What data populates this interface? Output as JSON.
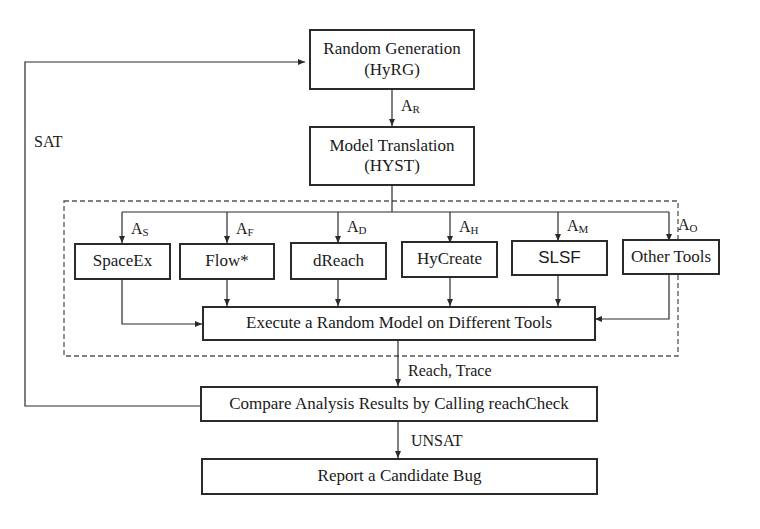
{
  "diagram": {
    "nodes": {
      "random_generation": {
        "line1": "Random Generation",
        "line2": "(HyRG)"
      },
      "model_translation": {
        "line1": "Model Translation",
        "line2": "(HYST)"
      },
      "tools": [
        {
          "label": "SpaceEx",
          "edge": "A",
          "sub": "S"
        },
        {
          "label": "Flow*",
          "edge": "A",
          "sub": "F"
        },
        {
          "label": "dReach",
          "edge": "A",
          "sub": "D"
        },
        {
          "label": "HyCreate",
          "edge": "A",
          "sub": "H"
        },
        {
          "label": "SLSF",
          "edge": "A",
          "sub": "M"
        },
        {
          "label": "Other Tools",
          "edge": "A",
          "sub": "O"
        }
      ],
      "execute": "Execute a Random Model on Different Tools",
      "compare": "Compare Analysis Results by Calling reachCheck",
      "report": "Report a Candidate Bug"
    },
    "edges": {
      "generation_to_translation": {
        "main": "A",
        "sub": "R"
      },
      "execute_to_compare": "Reach, Trace",
      "compare_to_report": "UNSAT",
      "compare_to_generation": "SAT"
    },
    "colors": {
      "line": "#2a2a2a",
      "dashed_group": "#555555"
    }
  }
}
